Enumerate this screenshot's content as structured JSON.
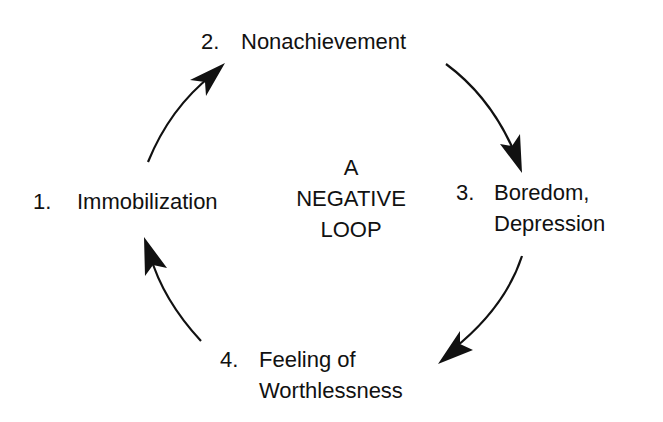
{
  "diagram": {
    "type": "cycle",
    "title_lines": [
      "A",
      "NEGATIVE",
      "LOOP"
    ],
    "nodes": [
      {
        "number": "1.",
        "lines": [
          "Immobilization"
        ]
      },
      {
        "number": "2.",
        "lines": [
          "Nonachievement"
        ]
      },
      {
        "number": "3.",
        "lines": [
          "Boredom,",
          "Depression"
        ]
      },
      {
        "number": "4.",
        "lines": [
          "Feeling of",
          "Worthlessness"
        ]
      }
    ],
    "edges": [
      {
        "from": "1. Immobilization",
        "to": "2. Nonachievement",
        "direction": "clockwise"
      },
      {
        "from": "2. Nonachievement",
        "to": "3. Boredom, Depression",
        "direction": "clockwise"
      },
      {
        "from": "3. Boredom, Depression",
        "to": "4. Feeling of Worthlessness",
        "direction": "clockwise"
      },
      {
        "from": "4. Feeling of Worthlessness",
        "to": "1. Immobilization",
        "direction": "clockwise"
      }
    ],
    "colors": {
      "background": "#ffffff",
      "ink": "#111111"
    }
  }
}
